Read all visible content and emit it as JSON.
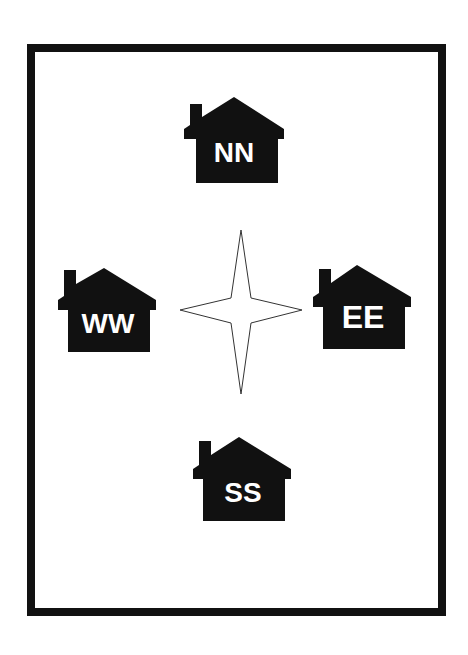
{
  "colors": {
    "ink": "#111111",
    "background": "#ffffff",
    "label": "#ffffff"
  },
  "houses": [
    {
      "id": "north",
      "label": "NN",
      "icon": "house-icon"
    },
    {
      "id": "west",
      "label": "WW",
      "icon": "house-icon"
    },
    {
      "id": "east",
      "label": "EE",
      "icon": "house-icon"
    },
    {
      "id": "south",
      "label": "SS",
      "icon": "house-icon"
    }
  ],
  "center": {
    "icon": "four-point-star-icon"
  }
}
